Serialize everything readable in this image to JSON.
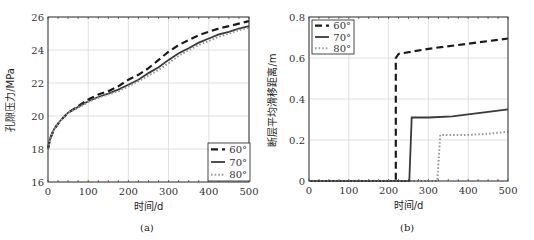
{
  "chart_data": [
    {
      "type": "line",
      "caption": "(a)",
      "title": "",
      "xlabel": "时间/d",
      "ylabel": "孔隙压力/MPa",
      "xlim": [
        0,
        500
      ],
      "ylim": [
        16,
        26
      ],
      "xticks": [
        0,
        100,
        200,
        300,
        400,
        500
      ],
      "yticks": [
        16,
        18,
        20,
        22,
        24,
        26
      ],
      "grid": true,
      "legend_position": "lower right",
      "series": [
        {
          "name": "60°",
          "style": "dashed",
          "x": [
            0,
            5,
            15,
            30,
            50,
            75,
            100,
            125,
            150,
            175,
            200,
            225,
            250,
            275,
            300,
            325,
            350,
            375,
            400,
            425,
            450,
            475,
            500
          ],
          "values": [
            18.0,
            18.6,
            19.2,
            19.7,
            20.2,
            20.6,
            21.0,
            21.3,
            21.5,
            21.8,
            22.2,
            22.5,
            22.9,
            23.4,
            23.9,
            24.3,
            24.6,
            24.9,
            25.1,
            25.3,
            25.45,
            25.6,
            25.75
          ]
        },
        {
          "name": "70°",
          "style": "solid",
          "x": [
            0,
            5,
            15,
            30,
            50,
            75,
            100,
            125,
            150,
            175,
            200,
            225,
            250,
            275,
            300,
            325,
            350,
            375,
            400,
            425,
            450,
            475,
            500
          ],
          "values": [
            18.0,
            18.6,
            19.2,
            19.7,
            20.2,
            20.55,
            20.9,
            21.15,
            21.35,
            21.6,
            21.9,
            22.2,
            22.6,
            22.95,
            23.4,
            23.8,
            24.1,
            24.45,
            24.7,
            24.95,
            25.1,
            25.3,
            25.45
          ]
        },
        {
          "name": "80°",
          "style": "dotted",
          "x": [
            0,
            5,
            15,
            30,
            50,
            75,
            100,
            125,
            150,
            175,
            200,
            225,
            250,
            275,
            300,
            325,
            350,
            375,
            400,
            425,
            450,
            475,
            500
          ],
          "values": [
            18.0,
            18.6,
            19.2,
            19.7,
            20.2,
            20.5,
            20.85,
            21.1,
            21.3,
            21.5,
            21.8,
            22.1,
            22.45,
            22.8,
            23.2,
            23.65,
            24.0,
            24.3,
            24.55,
            24.8,
            25.0,
            25.2,
            25.35
          ]
        }
      ]
    },
    {
      "type": "line",
      "caption": "(b)",
      "title": "",
      "xlabel": "时间/d",
      "ylabel": "断层平均滑移距离/m",
      "xlim": [
        0,
        500
      ],
      "ylim": [
        0,
        0.8
      ],
      "xticks": [
        0,
        100,
        200,
        300,
        400,
        500
      ],
      "yticks": [
        0,
        0.2,
        0.4,
        0.6,
        0.8
      ],
      "ytick_labels": [
        "0",
        "0.2",
        "0.4",
        "0.6",
        "0.8"
      ],
      "grid": true,
      "legend_position": "upper left",
      "series": [
        {
          "name": "60°",
          "style": "dashed",
          "x": [
            0,
            218,
            218,
            225,
            300,
            400,
            500
          ],
          "values": [
            0,
            0,
            0.6,
            0.62,
            0.645,
            0.67,
            0.695
          ]
        },
        {
          "name": "70°",
          "style": "solid",
          "x": [
            0,
            252,
            258,
            300,
            360,
            420,
            500
          ],
          "values": [
            0,
            0,
            0.31,
            0.31,
            0.315,
            0.33,
            0.35
          ]
        },
        {
          "name": "80°",
          "style": "dotted",
          "x": [
            0,
            322,
            330,
            400,
            450,
            500
          ],
          "values": [
            0,
            0,
            0.225,
            0.225,
            0.23,
            0.24
          ]
        }
      ]
    }
  ],
  "captions": {
    "a": "(a)",
    "b": "(b)"
  }
}
